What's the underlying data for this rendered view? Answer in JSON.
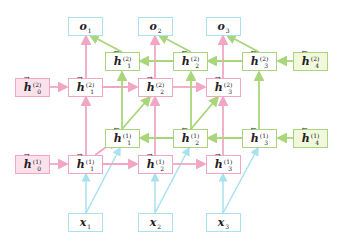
{
  "colors": {
    "forward": "#f1a7c3",
    "forward_fill": "#fbe1ec",
    "backward": "#a9d67a",
    "backward_fill": "#f1f8dc",
    "io": "#a8e2ef"
  },
  "outputs": [
    {
      "base": "o",
      "sub": "1"
    },
    {
      "base": "o",
      "sub": "2"
    },
    {
      "base": "o",
      "sub": "3"
    }
  ],
  "inputs": [
    {
      "base": "x",
      "sub": "1"
    },
    {
      "base": "x",
      "sub": "2"
    },
    {
      "base": "x",
      "sub": "3"
    }
  ],
  "layer2": {
    "forward": [
      {
        "arrow": "→",
        "base": "h",
        "sup": "(2)",
        "sub": "0"
      },
      {
        "arrow": "→",
        "base": "h",
        "sup": "(2)",
        "sub": "1"
      },
      {
        "arrow": "→",
        "base": "h",
        "sup": "(2)",
        "sub": "2"
      },
      {
        "arrow": "→",
        "base": "h",
        "sup": "(2)",
        "sub": "3"
      }
    ],
    "backward": [
      {
        "arrow": "←",
        "base": "h",
        "sup": "(2)",
        "sub": "1"
      },
      {
        "arrow": "←",
        "base": "h",
        "sup": "(2)",
        "sub": "2"
      },
      {
        "arrow": "←",
        "base": "h",
        "sup": "(2)",
        "sub": "3"
      },
      {
        "arrow": "←",
        "base": "h",
        "sup": "(2)",
        "sub": "4"
      }
    ]
  },
  "layer1": {
    "forward": [
      {
        "arrow": "→",
        "base": "h",
        "sup": "(1)",
        "sub": "0"
      },
      {
        "arrow": "→",
        "base": "h",
        "sup": "(1)",
        "sub": "1"
      },
      {
        "arrow": "→",
        "base": "h",
        "sup": "(1)",
        "sub": "2"
      },
      {
        "arrow": "→",
        "base": "h",
        "sup": "(1)",
        "sub": "3"
      }
    ],
    "backward": [
      {
        "arrow": "←",
        "base": "h",
        "sup": "(1)",
        "sub": "1"
      },
      {
        "arrow": "←",
        "base": "h",
        "sup": "(1)",
        "sub": "2"
      },
      {
        "arrow": "←",
        "base": "h",
        "sup": "(1)",
        "sub": "3"
      },
      {
        "arrow": "←",
        "base": "h",
        "sup": "(1)",
        "sub": "4"
      }
    ]
  }
}
